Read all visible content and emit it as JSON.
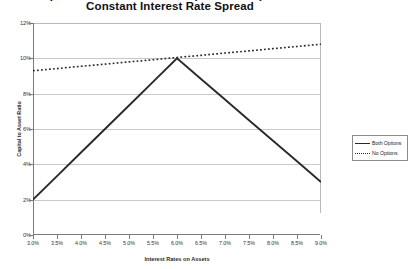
{
  "title": {
    "line1": "Capital to Asset Ratio with Options Compared to",
    "line2": "Constant Interest Rate Spread"
  },
  "axes": {
    "x_title": "Interest Rates on Assets",
    "y_title": "Capital to Asset Ratio"
  },
  "legend": {
    "items": [
      {
        "label": "Both Options",
        "style": "solid"
      },
      {
        "label": "No Options",
        "style": "dotted"
      }
    ]
  },
  "chart_data": {
    "type": "line",
    "title": "Capital to Asset Ratio with Options Compared to Constant Interest Rate Spread",
    "xlabel": "Interest Rates on Assets",
    "ylabel": "Capital to Asset Ratio",
    "x": [
      3.0,
      3.5,
      4.0,
      4.5,
      5.0,
      5.5,
      6.0,
      6.5,
      7.0,
      7.5,
      8.0,
      8.5,
      9.0
    ],
    "x_tick_labels": [
      "3.0%",
      "3.5%",
      "4.0%",
      "4.5%",
      "5.0%",
      "5.5%",
      "6.0%",
      "6.5%",
      "7.0%",
      "7.5%",
      "8.0%",
      "8.5%",
      "9.0%"
    ],
    "y_tick_labels": [
      "0%",
      "2%",
      "4%",
      "6%",
      "8%",
      "10%",
      "12%"
    ],
    "y_ticks": [
      0,
      2,
      4,
      6,
      8,
      10,
      12
    ],
    "xlim": [
      3.0,
      9.0
    ],
    "ylim": [
      0,
      12
    ],
    "grid": true,
    "legend_position": "right",
    "series": [
      {
        "name": "Both Options",
        "style": "solid",
        "color": "#2a2a2a",
        "values": [
          2.0,
          3.33,
          4.67,
          6.0,
          7.33,
          8.67,
          10.0,
          8.83,
          7.67,
          6.5,
          5.33,
          4.17,
          3.0
        ]
      },
      {
        "name": "No Options",
        "style": "dotted",
        "color": "#2a2a2a",
        "values": [
          9.3,
          9.42,
          9.55,
          9.67,
          9.8,
          9.92,
          10.05,
          10.17,
          10.3,
          10.42,
          10.55,
          10.67,
          10.8
        ]
      }
    ]
  }
}
